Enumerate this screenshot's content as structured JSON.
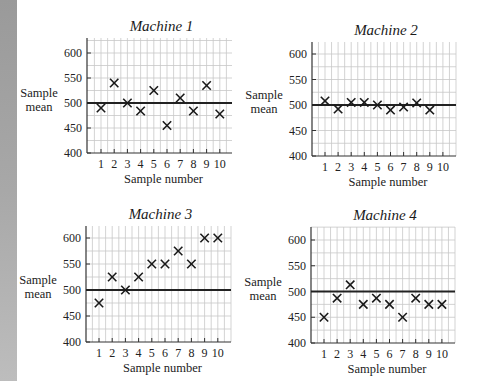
{
  "figure": {
    "ylabel_line1": "Sample",
    "ylabel_line2": "mean",
    "xlabel": "Sample number"
  },
  "chart_data": [
    {
      "type": "scatter",
      "title": "Machine 1",
      "xlabel": "Sample number",
      "ylabel": "Sample mean",
      "x": [
        1,
        2,
        3,
        4,
        5,
        6,
        7,
        8,
        9,
        10
      ],
      "values": [
        490,
        540,
        500,
        484,
        525,
        455,
        510,
        484,
        535,
        478
      ],
      "reference_line": 500,
      "ylim": [
        400,
        630
      ],
      "yticks": [
        400,
        450,
        500,
        550,
        600
      ],
      "xticks": [
        1,
        2,
        3,
        4,
        5,
        6,
        7,
        8,
        9,
        10
      ],
      "grid": true,
      "marker": "x",
      "box": {
        "left": 87,
        "top": 38,
        "width": 145,
        "y400": 153,
        "y600": 53,
        "x1": 101,
        "dx": 13.2
      }
    },
    {
      "type": "scatter",
      "title": "Machine 2",
      "xlabel": "Sample number",
      "ylabel": "Sample mean",
      "x": [
        1,
        2,
        3,
        4,
        5,
        6,
        7,
        8,
        9
      ],
      "values": [
        508,
        492,
        505,
        505,
        500,
        490,
        496,
        504,
        490
      ],
      "reference_line": 500,
      "ylim": [
        400,
        630
      ],
      "yticks": [
        400,
        450,
        500,
        550,
        600
      ],
      "xticks": [
        1,
        2,
        3,
        4,
        5,
        6,
        7,
        8,
        9,
        10
      ],
      "grid": true,
      "marker": "x",
      "box": {
        "left": 312,
        "top": 42,
        "width": 144,
        "y400": 156,
        "y600": 54,
        "x1": 325,
        "dx": 13.1
      }
    },
    {
      "type": "scatter",
      "title": "Machine 3",
      "xlabel": "Sample number",
      "ylabel": "Sample mean",
      "x": [
        1,
        2,
        3,
        4,
        5,
        6,
        7,
        8,
        9,
        10
      ],
      "values": [
        475,
        525,
        500,
        525,
        550,
        550,
        575,
        550,
        600,
        600
      ],
      "reference_line": 500,
      "ylim": [
        400,
        630
      ],
      "yticks": [
        400,
        450,
        500,
        550,
        600
      ],
      "xticks": [
        1,
        2,
        3,
        4,
        5,
        6,
        7,
        8,
        9,
        10
      ],
      "grid": true,
      "marker": "x",
      "box": {
        "left": 86,
        "top": 226,
        "width": 145,
        "y400": 342,
        "y600": 238,
        "x1": 99,
        "dx": 13.2
      }
    },
    {
      "type": "scatter",
      "title": "Machine 4",
      "xlabel": "Sample number",
      "ylabel": "Sample mean",
      "x": [
        1,
        2,
        3,
        4,
        5,
        6,
        7,
        8,
        9,
        10
      ],
      "values": [
        450,
        487,
        513,
        475,
        487,
        475,
        450,
        487,
        475,
        475
      ],
      "reference_line": 500,
      "ylim": [
        400,
        630
      ],
      "yticks": [
        400,
        450,
        500,
        550,
        600
      ],
      "xticks": [
        1,
        2,
        3,
        4,
        5,
        6,
        7,
        8,
        9,
        10
      ],
      "grid": true,
      "marker": "x",
      "box": {
        "left": 311,
        "top": 227,
        "width": 144,
        "y400": 343,
        "y600": 240,
        "x1": 324,
        "dx": 13.1
      }
    }
  ],
  "colors": {
    "grid": "#c8c8c8",
    "axis": "#333333",
    "reference_line": "#222222",
    "marker": "#1a1a1a",
    "edge_strip": "#a8a8a8"
  }
}
